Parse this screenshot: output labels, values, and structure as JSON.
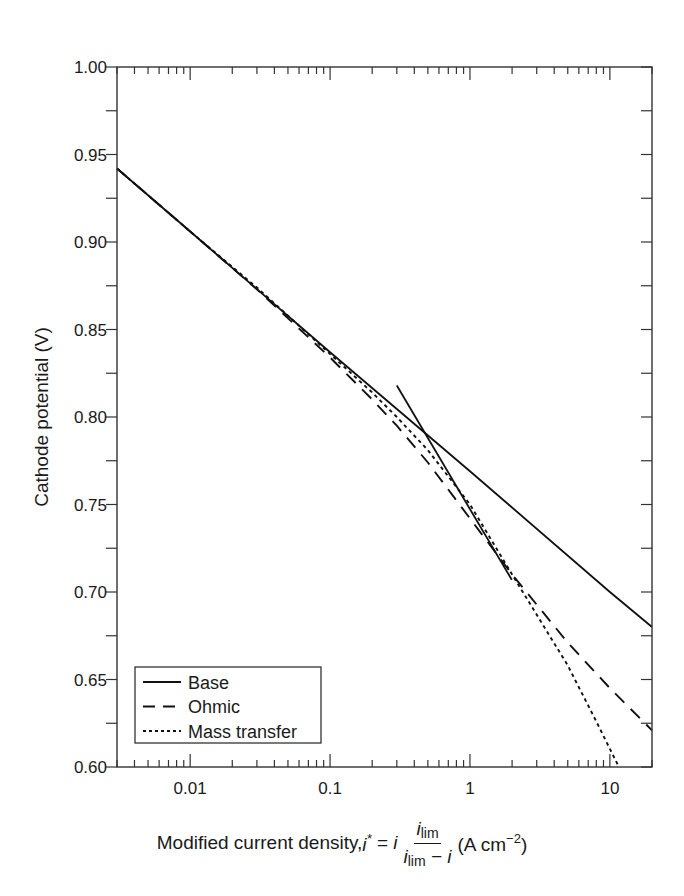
{
  "chart_data": {
    "type": "line",
    "title": "",
    "xlabel": "Modified current density, i* = i · i_lim / (i_lim − i) (A cm^-2)",
    "ylabel": "Cathode potential (V)",
    "xscale": "log",
    "xlim": [
      0.003,
      20
    ],
    "ylim": [
      0.6,
      1.0
    ],
    "x_ticks": [
      0.01,
      0.1,
      1,
      10
    ],
    "x_tick_labels": [
      "0.01",
      "0.1",
      "1",
      "10"
    ],
    "y_ticks": [
      0.6,
      0.65,
      0.7,
      0.75,
      0.8,
      0.85,
      0.9,
      0.95,
      1.0
    ],
    "y_tick_labels": [
      "0.60",
      "0.65",
      "0.70",
      "0.75",
      "0.80",
      "0.85",
      "0.90",
      "0.95",
      "1.00"
    ],
    "grid": false,
    "legend_position": "lower left",
    "series": [
      {
        "name": "Base",
        "style": "solid",
        "x": [
          0.003,
          0.01,
          0.1,
          1,
          10,
          20
        ],
        "y": [
          0.942,
          0.906,
          0.837,
          0.769,
          0.7,
          0.68
        ]
      },
      {
        "name": "Ohmic",
        "style": "dashed",
        "x": [
          0.003,
          0.01,
          0.03,
          0.1,
          0.2,
          0.3,
          0.5,
          1,
          2,
          5,
          10,
          20
        ],
        "y": [
          0.942,
          0.906,
          0.873,
          0.834,
          0.81,
          0.795,
          0.774,
          0.742,
          0.71,
          0.671,
          0.645,
          0.621
        ]
      },
      {
        "name": "Mass transfer",
        "style": "dotted",
        "x": [
          0.003,
          0.01,
          0.03,
          0.1,
          0.2,
          0.3,
          0.5,
          1,
          2,
          5,
          8,
          11.6
        ],
        "y": [
          0.942,
          0.906,
          0.874,
          0.836,
          0.814,
          0.8,
          0.781,
          0.75,
          0.71,
          0.658,
          0.626,
          0.6
        ]
      },
      {
        "name": "Double Tafel slope line (unlabeled)",
        "style": "solid",
        "x": [
          0.3,
          1.99
        ],
        "y": [
          0.818,
          0.707
        ]
      }
    ],
    "annotations": []
  },
  "axes": {
    "ylabel": "Cathode potential (V)",
    "xlabel_prefix": "Modified current density, ",
    "xlabel_var": "i",
    "xlabel_star": "*",
    "xlabel_eq": " = ",
    "xlabel_i": "i",
    "frac_num_i": "i",
    "frac_num_sub": "lim",
    "frac_den_i": "i",
    "frac_den_sub": "lim",
    "frac_den_rest": " − i",
    "xlabel_units": "(A cm",
    "xlabel_units_sup": "−2",
    "xlabel_units_close": ")"
  },
  "legend": {
    "items": [
      {
        "label": "Base",
        "style": "solid"
      },
      {
        "label": "Ohmic",
        "style": "dashed"
      },
      {
        "label": "Mass transfer",
        "style": "dotted"
      }
    ]
  },
  "colors": {
    "line": "#111111",
    "axis": "#333333",
    "text": "#1a1a1a",
    "background": "#ffffff"
  }
}
